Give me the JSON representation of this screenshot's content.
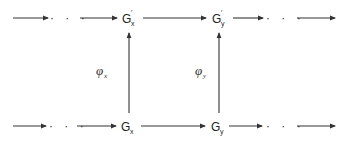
{
  "diagram": {
    "type": "commutative-diagram",
    "top_row": {
      "left_ellipsis": "· · ·",
      "node_x": {
        "base": "G",
        "prime": "′",
        "subscript": "x"
      },
      "node_y": {
        "base": "G",
        "prime": "′",
        "subscript": "y"
      },
      "right_ellipsis": "· · ·"
    },
    "bottom_row": {
      "left_ellipsis": "· · ·",
      "node_x": {
        "base": "G",
        "subscript": "x"
      },
      "node_y": {
        "base": "G",
        "subscript": "y"
      },
      "right_ellipsis": "· · ·"
    },
    "vertical_maps": [
      {
        "symbol": "φ",
        "subscript": "x",
        "from": "G_x",
        "to": "G'_x",
        "direction": "up"
      },
      {
        "symbol": "φ",
        "subscript": "y",
        "from": "G_y",
        "to": "G'_y",
        "direction": "up"
      }
    ],
    "colors": {
      "stroke": "#333333",
      "text": "#222222",
      "background": "#ffffff"
    }
  }
}
